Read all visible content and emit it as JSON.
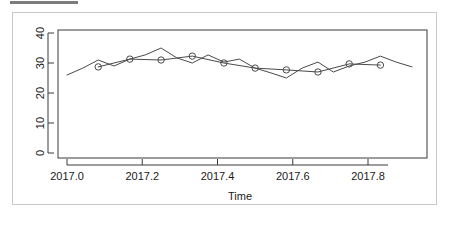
{
  "panel": {
    "top_bar_name": "clipped-toolbar-strip"
  },
  "chart_data": {
    "type": "line",
    "title": "",
    "xlabel": "Time",
    "ylabel": "",
    "xlim": [
      2016.98,
      2017.95
    ],
    "ylim": [
      -1,
      41
    ],
    "grid": false,
    "legend": "none",
    "xticks": [
      2017.0,
      2017.2,
      2017.4,
      2017.6,
      2017.8
    ],
    "xtick_labels": [
      "2017.0",
      "2017.2",
      "2017.4",
      "2017.6",
      "2017.8"
    ],
    "yticks": [
      0,
      10,
      20,
      30,
      40
    ],
    "ytick_labels": [
      "0",
      "10",
      "20",
      "30",
      "40"
    ],
    "series": [
      {
        "name": "observed",
        "style": "line",
        "marker": "none",
        "x": [
          2017.0,
          2017.042,
          2017.083,
          2017.125,
          2017.167,
          2017.208,
          2017.25,
          2017.292,
          2017.333,
          2017.375,
          2017.417,
          2017.458,
          2017.5,
          2017.542,
          2017.583,
          2017.625,
          2017.667,
          2017.708,
          2017.75,
          2017.792,
          2017.833,
          2017.875,
          2017.917
        ],
        "values": [
          26.0,
          28.3,
          31.0,
          29.0,
          31.3,
          32.7,
          35.0,
          31.7,
          30.0,
          32.7,
          30.3,
          31.3,
          28.3,
          26.7,
          25.0,
          28.3,
          30.3,
          27.0,
          29.0,
          30.3,
          32.3,
          30.3,
          28.7
        ]
      },
      {
        "name": "fitted",
        "style": "line",
        "marker": "circle",
        "x": [
          2017.083,
          2017.167,
          2017.25,
          2017.333,
          2017.417,
          2017.5,
          2017.583,
          2017.667,
          2017.75,
          2017.833
        ],
        "values": [
          28.7,
          31.3,
          31.0,
          32.3,
          30.0,
          28.3,
          27.7,
          27.0,
          29.7,
          29.3
        ]
      }
    ]
  },
  "axis": {
    "x_title": "Time"
  }
}
